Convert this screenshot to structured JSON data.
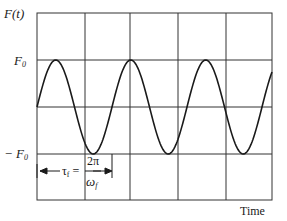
{
  "chart_data": {
    "type": "line",
    "title": "",
    "ylabel": "F(t)",
    "xlabel": "Time",
    "ytick_labels": [
      "F0",
      "-F0"
    ],
    "function": "F(t) = F0 sin(omega_f t)",
    "amplitude": 1,
    "periods_shown": 3.2,
    "grid": true,
    "grid_columns": 5,
    "grid_rows": 4,
    "annotation": {
      "text": "τf = 2π / ωf",
      "meaning": "period of forcing function, arrow spans one period from t=0"
    },
    "x": [
      0,
      0.25,
      0.5,
      0.75,
      1.0,
      1.25,
      1.5,
      1.75,
      2.0,
      2.25,
      2.5,
      2.75,
      3.0,
      3.2
    ],
    "x_unit": "periods",
    "values": [
      0,
      1,
      0,
      -1,
      0,
      1,
      0,
      -1,
      0,
      1,
      0,
      -1,
      0,
      0.95
    ]
  },
  "labels": {
    "y_axis": "F(t)",
    "f0_top": "F",
    "f0_top_sub": "0",
    "f0_bottom": "− F",
    "f0_bottom_sub": "0",
    "tau": "τ",
    "tau_sub": "f",
    "equals": "=",
    "numerator": "2π",
    "denominator": "ω",
    "denominator_sub": "f",
    "x_axis": "Time"
  },
  "colors": {
    "line": "#1a1a1a",
    "grid": "#333333",
    "background": "#ffffff"
  }
}
